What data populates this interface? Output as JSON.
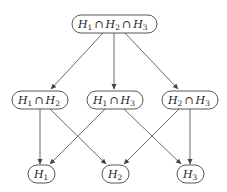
{
  "diagram": {
    "type": "lattice",
    "nodes": [
      {
        "id": "n123",
        "terms": [
          "H",
          "1",
          "H",
          "2",
          "H",
          "3"
        ],
        "label": "H₁ ∩ H₂ ∩ H₃"
      },
      {
        "id": "n12",
        "label": "H₁ ∩ H₂"
      },
      {
        "id": "n13",
        "label": "H₁ ∩ H₃"
      },
      {
        "id": "n23",
        "label": "H₂ ∩ H₃"
      },
      {
        "id": "n1",
        "label": "H₁"
      },
      {
        "id": "n2",
        "label": "H₂"
      },
      {
        "id": "n3",
        "label": "H₃"
      }
    ],
    "edges": [
      {
        "from": "n123",
        "to": "n12"
      },
      {
        "from": "n123",
        "to": "n13"
      },
      {
        "from": "n123",
        "to": "n23"
      },
      {
        "from": "n12",
        "to": "n1"
      },
      {
        "from": "n12",
        "to": "n2"
      },
      {
        "from": "n13",
        "to": "n1"
      },
      {
        "from": "n13",
        "to": "n3"
      },
      {
        "from": "n23",
        "to": "n2"
      },
      {
        "from": "n23",
        "to": "n3"
      }
    ],
    "symbols": {
      "letter": "H",
      "cap": "∩",
      "s1": "1",
      "s2": "2",
      "s3": "3"
    }
  }
}
